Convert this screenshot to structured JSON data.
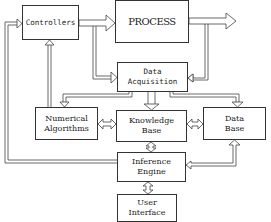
{
  "diagram": {
    "type": "block-diagram",
    "nodes": {
      "controllers": {
        "line1": "Controllers",
        "line2": ""
      },
      "process": {
        "line1": "PROCESS",
        "line2": ""
      },
      "data_acquisition": {
        "line1": "Data",
        "line2": "Acquisition"
      },
      "numerical_algorithms": {
        "line1": "Numerical",
        "line2": "Algorithms"
      },
      "knowledge_base": {
        "line1": "Knowledge",
        "line2": "Base"
      },
      "data_base": {
        "line1": "Data",
        "line2": "Base"
      },
      "inference_engine": {
        "line1": "Inference",
        "line2": "Engine"
      },
      "user_interface": {
        "line1": "User",
        "line2": "Interface"
      }
    },
    "edges": [
      {
        "from": "Controllers",
        "to": "PROCESS",
        "type": "arrow"
      },
      {
        "from": "PROCESS",
        "to": "output (right)",
        "type": "arrow"
      },
      {
        "from": "PROCESS output",
        "to": "Data Acquisition",
        "type": "arrow"
      },
      {
        "from": "Controllers output",
        "to": "Data Acquisition",
        "type": "arrow"
      },
      {
        "from": "Data Acquisition",
        "to": "Numerical Algorithms",
        "type": "arrow"
      },
      {
        "from": "Data Acquisition",
        "to": "Knowledge Base",
        "type": "arrow"
      },
      {
        "from": "Data Acquisition",
        "to": "Data Base",
        "type": "arrow"
      },
      {
        "from": "Numerical Algorithms",
        "to": "Controllers",
        "type": "arrow"
      },
      {
        "from": "Numerical Algorithms",
        "to": "Knowledge Base",
        "type": "bidirectional"
      },
      {
        "from": "Knowledge Base",
        "to": "Data Base",
        "type": "bidirectional"
      },
      {
        "from": "Knowledge Base",
        "to": "Inference Engine",
        "type": "bidirectional"
      },
      {
        "from": "Inference Engine",
        "to": "Controllers",
        "type": "arrow"
      },
      {
        "from": "Inference Engine",
        "to": "Data Base",
        "type": "bidirectional"
      },
      {
        "from": "Inference Engine",
        "to": "User Interface",
        "type": "bidirectional"
      }
    ]
  }
}
